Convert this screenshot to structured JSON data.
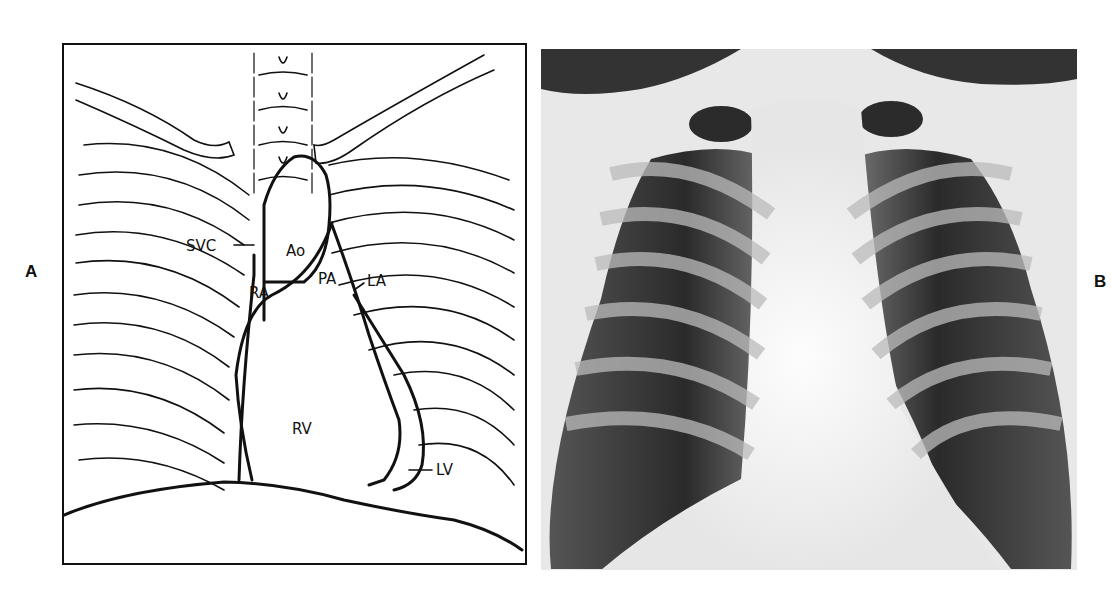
{
  "figure": {
    "panels": [
      {
        "label": "A",
        "type": "line-drawing"
      },
      {
        "label": "B",
        "type": "chest-x-ray"
      }
    ]
  },
  "diagram": {
    "labels": {
      "ao": "Ao",
      "svc": "SVC",
      "ra": "RA",
      "pa": "PA",
      "la": "LA",
      "rv": "RV",
      "lv": "LV"
    }
  }
}
